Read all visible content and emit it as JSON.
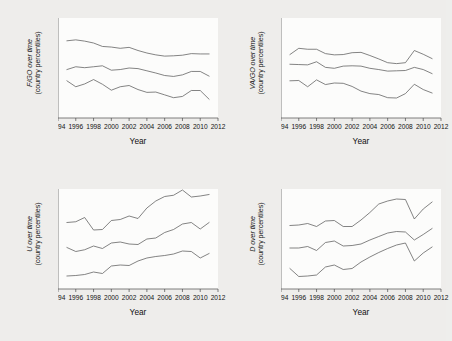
{
  "figure": {
    "background_color": "#eeedeb",
    "plot_background_color": "#fbfbfa",
    "line_color": "#5b5b5b",
    "axis_color": "#4a4a4a",
    "layout": "2x2 grid of line charts"
  },
  "common": {
    "xlabel": "Year",
    "ytitle_line2": "(country percentiles)",
    "xticks": [
      "1994",
      "1996",
      "1998",
      "2000",
      "2002",
      "2004",
      "2006",
      "2008",
      "2010",
      "2012"
    ],
    "xlim": [
      1994,
      2012
    ]
  },
  "chart_data": [
    {
      "type": "line",
      "panel": "top-left",
      "title": "",
      "ylabel": "F/GO over time (country percentiles)",
      "ylabel_symbol": "F/GO",
      "xlabel": "Year",
      "grid": false,
      "legend": "none",
      "xlim": [
        1994,
        2012
      ],
      "ylim": [
        0.42,
        0.58
      ],
      "yticks": [
        ".42",
        ".44",
        ".46",
        ".48",
        ".5",
        ".52",
        ".54",
        ".56",
        ".58"
      ],
      "ytick_values": [
        0.42,
        0.44,
        0.46,
        0.48,
        0.5,
        0.52,
        0.54,
        0.56,
        0.58
      ],
      "x": [
        1995,
        1996,
        1997,
        1998,
        1999,
        2000,
        2001,
        2002,
        2003,
        2004,
        2005,
        2006,
        2007,
        2008,
        2009,
        2010,
        2011
      ],
      "series": [
        {
          "name": "upper percentile",
          "values": [
            0.5435,
            0.545,
            0.543,
            0.54,
            0.5345,
            0.5335,
            0.5315,
            0.533,
            0.528,
            0.524,
            0.521,
            0.519,
            0.5195,
            0.5205,
            0.523,
            0.5225,
            0.5225
          ]
        },
        {
          "name": "median",
          "values": [
            0.4975,
            0.502,
            0.5005,
            0.502,
            0.5035,
            0.4965,
            0.4975,
            0.5,
            0.499,
            0.4955,
            0.492,
            0.488,
            0.4865,
            0.489,
            0.4945,
            0.4945,
            0.487
          ]
        },
        {
          "name": "lower percentile",
          "values": [
            0.4795,
            0.47,
            0.4745,
            0.4815,
            0.474,
            0.4645,
            0.47,
            0.472,
            0.4655,
            0.461,
            0.4615,
            0.457,
            0.4525,
            0.4545,
            0.464,
            0.464,
            0.45
          ]
        }
      ]
    },
    {
      "type": "line",
      "panel": "top-right",
      "title": "",
      "ylabel": "VA/GO over time (country percentiles)",
      "ylabel_symbol": "VA/GO",
      "xlabel": "Year",
      "grid": false,
      "legend": "none",
      "xlim": [
        1994,
        2012
      ],
      "ylim": [
        0.42,
        0.58
      ],
      "yticks": [
        ".42",
        ".44",
        ".46",
        ".48",
        ".5",
        ".52",
        ".54",
        ".56",
        ".58"
      ],
      "ytick_values": [
        0.42,
        0.44,
        0.46,
        0.48,
        0.5,
        0.52,
        0.54,
        0.56,
        0.58
      ],
      "x": [
        1995,
        1996,
        1997,
        1998,
        1999,
        2000,
        2001,
        2002,
        2003,
        2004,
        2005,
        2006,
        2007,
        2008,
        2009,
        2010,
        2011
      ],
      "series": [
        {
          "name": "upper percentile",
          "values": [
            0.5215,
            0.5315,
            0.53,
            0.53,
            0.523,
            0.521,
            0.5215,
            0.5245,
            0.525,
            0.52,
            0.5145,
            0.5085,
            0.507,
            0.5085,
            0.528,
            0.522,
            0.515
          ]
        },
        {
          "name": "median",
          "values": [
            0.506,
            0.5055,
            0.505,
            0.51,
            0.501,
            0.4995,
            0.503,
            0.5035,
            0.503,
            0.4995,
            0.4975,
            0.495,
            0.4955,
            0.496,
            0.501,
            0.4975,
            0.491
          ]
        },
        {
          "name": "lower percentile",
          "values": [
            0.4795,
            0.48,
            0.47,
            0.481,
            0.4735,
            0.476,
            0.4755,
            0.4705,
            0.463,
            0.459,
            0.4575,
            0.4525,
            0.452,
            0.459,
            0.474,
            0.4655,
            0.46
          ]
        }
      ]
    },
    {
      "type": "line",
      "panel": "bottom-left",
      "title": "",
      "ylabel": "U over time (country percentiles)",
      "ylabel_symbol": "U",
      "xlabel": "Year",
      "grid": false,
      "legend": "none",
      "xlim": [
        1994,
        2012
      ],
      "ylim": [
        1.8,
        2.2
      ],
      "yticks": [
        "1.8",
        "1.9",
        "2",
        "2.1",
        "2.2"
      ],
      "ytick_values": [
        1.8,
        1.9,
        2.0,
        2.1,
        2.2
      ],
      "x": [
        1995,
        1996,
        1997,
        1998,
        1999,
        2000,
        2001,
        2002,
        2003,
        2004,
        2005,
        2006,
        2007,
        2008,
        2009,
        2010,
        2011
      ],
      "series": [
        {
          "name": "upper percentile",
          "values": [
            2.066,
            2.069,
            2.086,
            2.036,
            2.038,
            2.074,
            2.078,
            2.092,
            2.082,
            2.124,
            2.152,
            2.17,
            2.175,
            2.196,
            2.168,
            2.172,
            2.178
          ]
        },
        {
          "name": "median",
          "values": [
            1.966,
            1.95,
            1.957,
            1.972,
            1.962,
            1.984,
            1.988,
            1.98,
            1.978,
            2.0,
            2.004,
            2.026,
            2.038,
            2.06,
            2.066,
            2.04,
            2.066
          ]
        },
        {
          "name": "lower percentile",
          "values": [
            1.852,
            1.854,
            1.858,
            1.868,
            1.862,
            1.892,
            1.896,
            1.894,
            1.912,
            1.924,
            1.93,
            1.934,
            1.94,
            1.952,
            1.95,
            1.924,
            1.942
          ]
        }
      ]
    },
    {
      "type": "line",
      "panel": "bottom-right",
      "title": "",
      "ylabel": "D over time (country percentiles)",
      "ylabel_symbol": "D",
      "xlabel": "Year",
      "grid": false,
      "legend": "none",
      "xlim": [
        1994,
        2012
      ],
      "ylim": [
        1.8,
        2.2
      ],
      "yticks": [
        "1.8",
        "1.9",
        "2",
        "2.1",
        "2.2"
      ],
      "ytick_values": [
        1.8,
        1.9,
        2.0,
        2.1,
        2.2
      ],
      "x": [
        1995,
        1996,
        1997,
        1998,
        1999,
        2000,
        2001,
        2002,
        2003,
        2004,
        2005,
        2006,
        2007,
        2008,
        2009,
        2010,
        2011
      ],
      "series": [
        {
          "name": "upper percentile",
          "values": [
            2.054,
            2.056,
            2.062,
            2.05,
            2.072,
            2.074,
            2.05,
            2.05,
            2.076,
            2.106,
            2.14,
            2.152,
            2.16,
            2.158,
            2.08,
            2.12,
            2.148
          ]
        },
        {
          "name": "median",
          "values": [
            1.964,
            1.964,
            1.97,
            1.954,
            1.986,
            1.992,
            1.972,
            1.974,
            1.98,
            1.996,
            2.01,
            2.024,
            2.03,
            2.028,
            1.996,
            2.018,
            2.042
          ]
        },
        {
          "name": "lower percentile",
          "values": [
            1.882,
            1.85,
            1.852,
            1.856,
            1.888,
            1.896,
            1.878,
            1.882,
            1.908,
            1.928,
            1.946,
            1.962,
            1.976,
            1.984,
            1.912,
            1.944,
            1.968
          ]
        }
      ]
    }
  ]
}
